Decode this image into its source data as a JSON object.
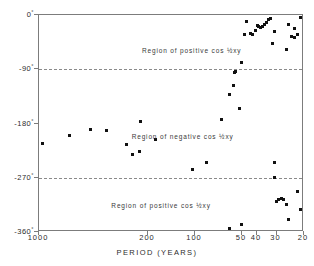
{
  "figure": {
    "background_color": "#ffffff",
    "frame_color": "#7c7c7c",
    "point_color": "#111111",
    "axis_title_x": "PERIOD (YEARS)"
  },
  "axes": {
    "x": {
      "label": "PERIOD (YEARS)",
      "scale": "log-reversed",
      "min": 1000,
      "max": 20,
      "ticks": [
        {
          "value": 1000,
          "label": "1000"
        },
        {
          "value": 200,
          "label": "200"
        },
        {
          "value": 100,
          "label": "100"
        },
        {
          "value": 50,
          "label": "50"
        },
        {
          "value": 40,
          "label": "40"
        },
        {
          "value": 30,
          "label": "30"
        },
        {
          "value": 20,
          "label": "20"
        }
      ]
    },
    "y": {
      "label": "",
      "scale": "linear",
      "min": 0,
      "max": -360,
      "ticks": [
        {
          "value": -360,
          "label": "-360",
          "degree": "°"
        },
        {
          "value": -270,
          "label": "-270",
          "degree": "°"
        },
        {
          "value": -180,
          "label": "-180",
          "degree": "°"
        },
        {
          "value": -90,
          "label": "-90",
          "degree": "°"
        },
        {
          "value": 0,
          "label": "0",
          "degree": "°"
        }
      ]
    }
  },
  "reference_lines": [
    {
      "value": -270,
      "style": "dashed"
    },
    {
      "value": -90,
      "style": "dashed"
    }
  ],
  "annotations": [
    {
      "text": "Region of positive cos ½xy",
      "x": 165,
      "y": -315
    },
    {
      "text": "Region of negative cos ½xy",
      "x": 120,
      "y": -200
    },
    {
      "text": "Region of positive cos ½xy",
      "x": 105,
      "y": -58
    }
  ],
  "chart_data": {
    "type": "scatter",
    "title": "",
    "xlabel": "PERIOD (YEARS)",
    "ylabel": "",
    "xscale": "log",
    "xlim": [
      1000,
      20
    ],
    "ylim": [
      0,
      -360
    ],
    "grid": false,
    "legend": "none",
    "series": [
      {
        "name": "observations",
        "points": [
          {
            "x": 950,
            "y": -213
          },
          {
            "x": 640,
            "y": -200
          },
          {
            "x": 470,
            "y": -190
          },
          {
            "x": 370,
            "y": -192
          },
          {
            "x": 275,
            "y": -215
          },
          {
            "x": 250,
            "y": -232
          },
          {
            "x": 228,
            "y": -227
          },
          {
            "x": 222,
            "y": -177
          },
          {
            "x": 180,
            "y": -207
          },
          {
            "x": 103,
            "y": -256
          },
          {
            "x": 84,
            "y": -245
          },
          {
            "x": 68,
            "y": -173
          },
          {
            "x": 60,
            "y": -132
          },
          {
            "x": 57,
            "y": -117
          },
          {
            "x": 56,
            "y": -96
          },
          {
            "x": 55,
            "y": -93
          },
          {
            "x": 52,
            "y": -155
          },
          {
            "x": 50,
            "y": -79
          },
          {
            "x": 48,
            "y": -33
          },
          {
            "x": 47,
            "y": -11
          },
          {
            "x": 44,
            "y": -30
          },
          {
            "x": 43,
            "y": -33
          },
          {
            "x": 41,
            "y": -25
          },
          {
            "x": 40,
            "y": -18
          },
          {
            "x": 39,
            "y": -19
          },
          {
            "x": 38,
            "y": -20
          },
          {
            "x": 37,
            "y": -19
          },
          {
            "x": 36,
            "y": -15
          },
          {
            "x": 35,
            "y": -13
          },
          {
            "x": 34,
            "y": -8
          },
          {
            "x": 33,
            "y": -6
          },
          {
            "x": 32,
            "y": -47
          },
          {
            "x": 31,
            "y": -28
          },
          {
            "x": 31,
            "y": -270
          },
          {
            "x": 31,
            "y": -245
          },
          {
            "x": 30,
            "y": -310
          },
          {
            "x": 29,
            "y": -306
          },
          {
            "x": 28,
            "y": -305
          },
          {
            "x": 27,
            "y": -306
          },
          {
            "x": 26,
            "y": -315
          },
          {
            "x": 26,
            "y": -57
          },
          {
            "x": 25,
            "y": -15
          },
          {
            "x": 25,
            "y": -340
          },
          {
            "x": 24,
            "y": -35
          },
          {
            "x": 23,
            "y": -22
          },
          {
            "x": 23,
            "y": -38
          },
          {
            "x": 22,
            "y": -32
          },
          {
            "x": 22,
            "y": -292
          },
          {
            "x": 21,
            "y": -322
          },
          {
            "x": 21,
            "y": -4
          },
          {
            "x": 60,
            "y": -355
          },
          {
            "x": 50,
            "y": -348
          }
        ]
      }
    ]
  }
}
